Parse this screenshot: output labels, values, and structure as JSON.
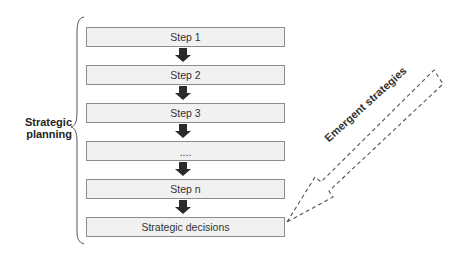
{
  "diagram": {
    "side_label_line1": "Strategic",
    "side_label_line2": "planning",
    "steps": [
      {
        "label": "Step 1"
      },
      {
        "label": "Step 2"
      },
      {
        "label": "Step 3"
      },
      {
        "label": "...."
      },
      {
        "label": "Step n"
      },
      {
        "label": "Strategic decisions"
      }
    ],
    "emergent_label": "Emergent strategies",
    "colors": {
      "box_fill": "#f1f1f1",
      "box_border": "#8c8c8c",
      "arrow_fill": "#2b2b2b",
      "dashed_stroke": "#555555",
      "text": "#333333"
    }
  }
}
